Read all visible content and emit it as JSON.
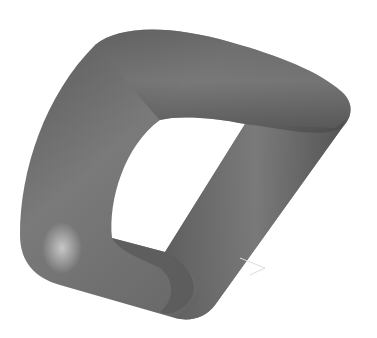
{
  "scene": {
    "description": "3D rendered rounded-square torus (squarish ring tube) in gray shading",
    "background": "#ffffff",
    "colors": {
      "tube_dark": "#3c3c3c",
      "tube_mid": "#6e6e6e",
      "tube_light": "#a8a8a8",
      "highlight": "#c8c8c8"
    }
  }
}
